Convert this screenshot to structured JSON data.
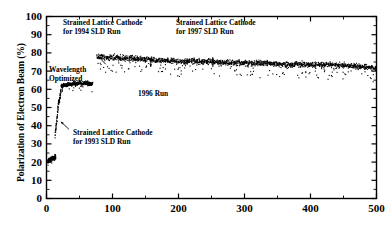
{
  "chart_data": {
    "type": "scatter",
    "title": "",
    "xlabel": "",
    "ylabel": "Polarization of Electron Beam (%)",
    "xlim": [
      0,
      500
    ],
    "ylim": [
      0,
      100
    ],
    "xticks": [
      0,
      100,
      200,
      300,
      400,
      500
    ],
    "xtick_labels": [
      "0",
      "100",
      "200",
      "300",
      "400",
      "500"
    ],
    "xminor_step": 50,
    "yticks": [
      0,
      10,
      20,
      30,
      40,
      50,
      60,
      70,
      80,
      90,
      100
    ],
    "ytick_labels": [
      "0",
      "10",
      "20",
      "30",
      "40",
      "50",
      "60",
      "70",
      "80",
      "90",
      "100"
    ],
    "yminor_step": 5,
    "grid": false,
    "legend": "none",
    "marker_color": "#000000",
    "frame_color": "#000000",
    "series": [
      {
        "name": "1993 SLD Run (bulk GaAs)",
        "x": [
          2,
          3,
          4,
          5,
          6,
          7,
          8,
          9,
          10,
          11,
          12,
          13,
          14
        ],
        "y": [
          20.5,
          21.0,
          20.8,
          21.4,
          21.2,
          22.0,
          21.6,
          22.3,
          22.0,
          22.6,
          22.2,
          23.0,
          22.4
        ],
        "note": "low polarization cluster near start"
      },
      {
        "name": "1993 Strained Lattice Cathode ramp",
        "x": [
          13,
          14,
          15,
          16,
          17,
          18,
          19,
          20,
          21,
          22
        ],
        "y": [
          34.0,
          39.5,
          41.0,
          44.0,
          49.0,
          52.0,
          53.5,
          55.0,
          57.5,
          59.0
        ],
        "note": "rapid rise after strained lattice cathode installed"
      },
      {
        "name": "1994-1995 Wavelength Optimized plateau",
        "x": [
          22,
          26,
          30,
          34,
          38,
          42,
          46,
          50,
          54,
          58,
          62,
          66,
          70
        ],
        "y": [
          61.5,
          62.5,
          62.0,
          63.0,
          62.4,
          63.2,
          62.8,
          63.5,
          63.0,
          63.8,
          63.2,
          62.6,
          63.4
        ],
        "note": "stable band near 62-64%"
      },
      {
        "name": "1994 SLD Run onward high plateau",
        "x": [
          76,
          90,
          110,
          130,
          150,
          170,
          190,
          210,
          230,
          250,
          270,
          290,
          310,
          330,
          350,
          370,
          390,
          410,
          430,
          450,
          470,
          490,
          500
        ],
        "y": [
          78.0,
          77.6,
          77.2,
          77.0,
          76.4,
          76.0,
          75.6,
          75.2,
          75.6,
          75.0,
          74.6,
          74.8,
          74.2,
          74.6,
          74.0,
          73.6,
          73.8,
          73.2,
          73.6,
          73.0,
          72.6,
          72.0,
          71.4
        ],
        "note": "main high-polarization band slowly declining 78% to 72%"
      }
    ],
    "annotations": [
      {
        "id": "ann-1994",
        "text_line1": "Strained Lattice Cathode",
        "text_line2": "for 1994 SLD Run",
        "arrow": "diagonal-down-left",
        "points_to_x": 76,
        "points_to_y": 79
      },
      {
        "id": "ann-1997",
        "text_line1": "Strained Lattice Cathode",
        "text_line2": "for 1997 SLD Run",
        "arrow": "down",
        "points_to_x": 252,
        "points_to_y": 79
      },
      {
        "id": "ann-wavelength",
        "text_line1": "Wavelength",
        "text_line2": "Optimized",
        "arrow": "down",
        "points_to_x": 24,
        "points_to_y": 64
      },
      {
        "id": "ann-1996",
        "text_line1": "1996 Run",
        "text_line2": "",
        "arrow": "up",
        "points_to_x": 158,
        "points_to_y": 72
      },
      {
        "id": "ann-1993",
        "text_line1": "Strained Lattice Cathode",
        "text_line2": "for 1993 SLD Run",
        "arrow": "diagonal-up-left",
        "points_to_x": 18,
        "points_to_y": 43
      }
    ]
  }
}
